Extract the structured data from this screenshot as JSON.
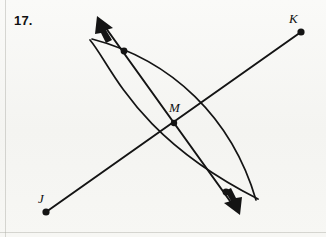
{
  "figure": {
    "problem_number": "17.",
    "width": 326,
    "height": 237,
    "background_color": "#f7f7f5",
    "ink_color": "#141414"
  },
  "labels": {
    "J": "J",
    "K": "K",
    "M": "M"
  },
  "points": {
    "J": {
      "label": "J",
      "x": 46,
      "y": 212,
      "dot_radius": 3.6
    },
    "K": {
      "label": "K",
      "x": 301,
      "y": 32,
      "dot_radius": 3.6
    },
    "M": {
      "label": "M",
      "x": 174,
      "y": 123,
      "dot_radius": 3.2
    },
    "arc_top": {
      "label": "",
      "x": 124,
      "y": 51,
      "dot_radius": 3.4
    },
    "arc_bottom": {
      "label": "",
      "x": 226,
      "y": 192,
      "dot_radius": 3.4
    }
  },
  "segments": {
    "JK": {
      "x1": 46,
      "y1": 212,
      "x2": 301,
      "y2": 32,
      "stroke_width": 2.0
    }
  },
  "rays": {
    "bisector": {
      "x1": 97,
      "y1": 16,
      "x2": 240,
      "y2": 215,
      "stroke_width": 2.0,
      "arrow_start": true,
      "arrow_end": true
    }
  },
  "arcs": {
    "left_arc": {
      "start_x": 90,
      "start_y": 40,
      "control_x": 96,
      "control_y": 123,
      "end_x": 258,
      "end_y": 199,
      "stroke_width": 1.7,
      "bulge": "left"
    },
    "right_arc": {
      "start_x": 92,
      "start_y": 39,
      "control_x": 258,
      "control_y": 116,
      "end_x": 256,
      "end_y": 200,
      "stroke_width": 1.7,
      "bulge": "right"
    }
  },
  "arrowheads": {
    "upper_left": {
      "tip_x": 97,
      "tip_y": 16
    },
    "lower_right": {
      "tip_x": 240,
      "tip_y": 215
    }
  },
  "borders": {
    "left_rule_x": 5,
    "bottom_rule_y": 232,
    "rule_color": "#aaaaa5"
  }
}
